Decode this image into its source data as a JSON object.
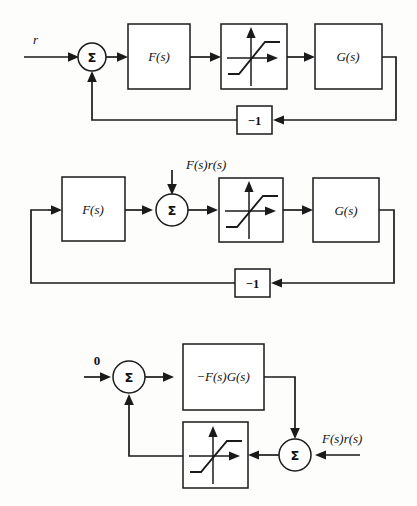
{
  "figure": {
    "kind": "control-system-block-diagram",
    "background_color": "#fdfdfc",
    "line_color": "#1a1a1a",
    "panel_count": 3
  },
  "diagrams": [
    {
      "id": "top",
      "name": "original-feedback-loop",
      "blocks": [
        {
          "name": "linear-filter-block",
          "label": "F(s)"
        },
        {
          "name": "saturation-block",
          "label": ""
        },
        {
          "name": "plant-block",
          "label": "G(s)"
        },
        {
          "name": "negative-gain-block",
          "label": "−1"
        }
      ],
      "junctions": [
        {
          "name": "summing-junction",
          "label": "Σ"
        }
      ],
      "signals": [
        {
          "name": "reference-input-label",
          "label": "r"
        }
      ]
    },
    {
      "id": "middle",
      "name": "rearranged-loop-with-injected-input",
      "blocks": [
        {
          "name": "linear-filter-block",
          "label": "F(s)"
        },
        {
          "name": "saturation-block",
          "label": ""
        },
        {
          "name": "plant-block",
          "label": "G(s)"
        },
        {
          "name": "negative-gain-block",
          "label": "−1"
        }
      ],
      "junctions": [
        {
          "name": "summing-junction",
          "label": "Σ"
        }
      ],
      "signals": [
        {
          "name": "injected-input-label",
          "label": "F(s)r(s)"
        }
      ]
    },
    {
      "id": "bottom",
      "name": "reduced-loop-form",
      "blocks": [
        {
          "name": "combined-plant-block",
          "label": "−F(s)G(s)"
        },
        {
          "name": "saturation-block",
          "label": ""
        }
      ],
      "junctions": [
        {
          "name": "summing-junction-left",
          "label": "Σ"
        },
        {
          "name": "summing-junction-right",
          "label": "Σ"
        }
      ],
      "signals": [
        {
          "name": "zero-input-label",
          "label": "0"
        },
        {
          "name": "injected-input-label",
          "label": "F(s)r(s)"
        }
      ]
    }
  ]
}
